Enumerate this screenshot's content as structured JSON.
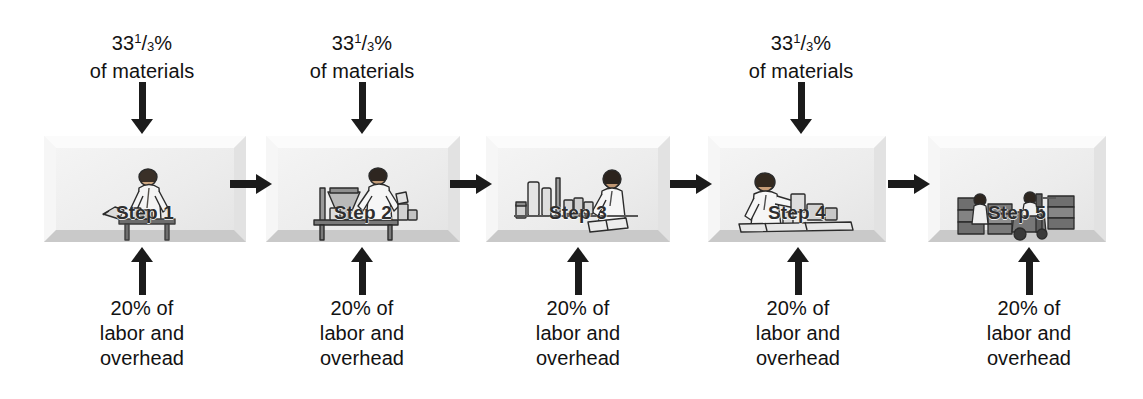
{
  "diagram": {
    "colors": {
      "arrow": "#1b1b1b",
      "box_face": "#f2f2f2",
      "box_shadow_edge": "#c9c9c9",
      "text": "#121212",
      "step_label": "#2e2e2e"
    },
    "materials_label": {
      "whole": "33",
      "numerator": "1",
      "slash": "/",
      "denominator": "3",
      "percent": "%",
      "line2": "of materials"
    },
    "conversion_label": {
      "line1": "20% of",
      "line2": "labor and",
      "line3": "overhead"
    },
    "steps": [
      {
        "id": "step-1",
        "label": "Step 1",
        "art": "worker-at-bench-icon",
        "has_materials_input": true,
        "has_conversion_input": true
      },
      {
        "id": "step-2",
        "label": "Step 2",
        "art": "worker-mixing-vat-icon",
        "has_materials_input": true,
        "has_conversion_input": true
      },
      {
        "id": "step-3",
        "label": "Step 3",
        "art": "inspector-with-jars-icon",
        "has_materials_input": false,
        "has_conversion_input": true
      },
      {
        "id": "step-4",
        "label": "Step 4",
        "art": "worker-packaging-icon",
        "has_materials_input": true,
        "has_conversion_input": true
      },
      {
        "id": "step-5",
        "label": "Step 5",
        "art": "forklift-warehouse-icon",
        "has_materials_input": false,
        "has_conversion_input": true
      }
    ],
    "flow_arrows": [
      {
        "id": "arrow-step1-to-step2",
        "direction": "right"
      },
      {
        "id": "arrow-step2-to-step3",
        "direction": "right"
      },
      {
        "id": "arrow-step3-to-step4",
        "direction": "right"
      },
      {
        "id": "arrow-step4-to-step5",
        "direction": "right"
      }
    ]
  }
}
